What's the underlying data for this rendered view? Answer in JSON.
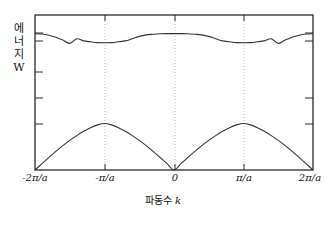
{
  "figure": {
    "ylabel_chars": [
      "에",
      "너",
      "지"
    ],
    "ylabel_symbol": "W",
    "xtitle_text": "파동수 ",
    "xtitle_symbol": "k"
  },
  "chart_data": {
    "type": "line",
    "title": "",
    "subtitle": "",
    "xlabel": "파동수 k",
    "ylabel": "에너지 W",
    "grid": true,
    "grid_style": "dotted-vertical",
    "legend": "none",
    "xlim": [
      -2,
      2
    ],
    "ylim": [
      0,
      1
    ],
    "x_unit": "π/a",
    "xtick_values": [
      -2,
      -1,
      0,
      1,
      2
    ],
    "xtick_labels": [
      "-2π/a",
      "-π/a",
      "0",
      "π/a",
      "2π/a"
    ],
    "ytick_values": [
      0.26,
      0.3,
      0.5,
      0.66,
      0.81
    ],
    "ytick_labels": [
      "",
      "",
      "",
      "",
      ""
    ],
    "series": [
      {
        "name": "lower band",
        "comment": "first Brillouin zone band, zero at k=0 and k=±2π/a, peaks at k=±π/a",
        "x": [
          -2.0,
          -1.9,
          -1.8,
          -1.7,
          -1.6,
          -1.5,
          -1.4,
          -1.3,
          -1.2,
          -1.1,
          -1.0,
          -0.9,
          -0.8,
          -0.7,
          -0.6,
          -0.5,
          -0.4,
          -0.3,
          -0.2,
          -0.1,
          0.0,
          0.1,
          0.2,
          0.3,
          0.4,
          0.5,
          0.6,
          0.7,
          0.8,
          0.9,
          1.0,
          1.1,
          1.2,
          1.3,
          1.4,
          1.5,
          1.6,
          1.7,
          1.8,
          1.9,
          2.0
        ],
        "y": [
          0.0,
          0.041,
          0.081,
          0.12,
          0.157,
          0.191,
          0.222,
          0.25,
          0.273,
          0.291,
          0.3,
          0.291,
          0.273,
          0.25,
          0.222,
          0.191,
          0.157,
          0.12,
          0.081,
          0.041,
          0.0,
          0.041,
          0.081,
          0.12,
          0.157,
          0.191,
          0.222,
          0.25,
          0.273,
          0.291,
          0.3,
          0.291,
          0.273,
          0.25,
          0.222,
          0.191,
          0.157,
          0.12,
          0.081,
          0.041,
          0.0
        ]
      },
      {
        "name": "upper band",
        "comment": "second band, maxima at k=0 and k=±2π/a, minima at k=±π/a",
        "x": [
          -2.0,
          -1.9,
          -1.8,
          -1.7,
          -1.6,
          -1.5,
          -1.4,
          -1.3,
          -1.2,
          -1.1,
          -1.0,
          -0.9,
          -0.8,
          -0.7,
          -0.6,
          -0.5,
          -0.4,
          -0.3,
          -0.2,
          -0.1,
          0.0,
          0.1,
          0.2,
          0.3,
          0.4,
          0.5,
          0.6,
          0.7,
          0.8,
          0.9,
          1.0,
          1.1,
          1.2,
          1.3,
          1.4,
          1.5,
          1.6,
          1.7,
          1.8,
          1.9,
          2.0
        ],
        "y": [
          0.88,
          0.877,
          0.869,
          0.856,
          0.838,
          0.817,
          0.847,
          0.833,
          0.827,
          0.822,
          0.821,
          0.822,
          0.827,
          0.833,
          0.847,
          0.862,
          0.872,
          0.876,
          0.879,
          0.88,
          0.88,
          0.88,
          0.879,
          0.876,
          0.872,
          0.862,
          0.847,
          0.833,
          0.827,
          0.822,
          0.821,
          0.822,
          0.827,
          0.833,
          0.847,
          0.817,
          0.838,
          0.856,
          0.869,
          0.877,
          0.88
        ]
      }
    ],
    "gridlines_x": [
      -1,
      0,
      1
    ],
    "frame": {
      "left": -2,
      "right": 2,
      "bottom": 0,
      "top": 1
    }
  }
}
